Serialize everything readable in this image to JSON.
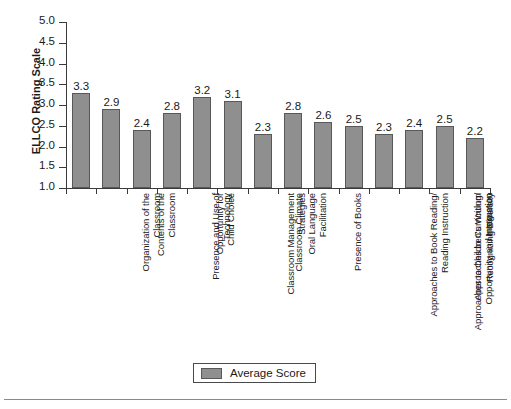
{
  "chart_data": {
    "type": "bar",
    "title": "",
    "xlabel": "",
    "ylabel": "ELLCO Rating Scale",
    "ylim": [
      1.0,
      5.0
    ],
    "ytick_labels": [
      "5.0",
      "4.5",
      "4.0",
      "3.5",
      "3.0",
      "2.5",
      "2.0",
      "1.5",
      "1.0"
    ],
    "ytick_values": [
      5.0,
      4.5,
      4.0,
      3.5,
      3.0,
      2.5,
      2.0,
      1.5,
      1.0
    ],
    "grid": false,
    "legend_position": "bottom-center",
    "legend": [
      "Average Score"
    ],
    "bar_color": "#8f8f8f",
    "bar_edge_color": "#585858",
    "categories": [
      [
        "Organization of the",
        "Classroom"
      ],
      [
        "Contents of the",
        "Classroom"
      ],
      [
        "Presence and Use of",
        "Technology"
      ],
      [
        "Opportunity for",
        "Child Choice"
      ],
      [
        "Classroom Management",
        "Strategies"
      ],
      [
        "Classroom Climate"
      ],
      [
        "Oral Language",
        "Facilitation"
      ],
      [
        "Presence of Books"
      ],
      [
        "Approaches to Book Reading/",
        "Reading Instruction"
      ],
      [
        "Approaches to Children's Writing/",
        "Opportunity and Instruction"
      ],
      [
        "Approaches to Curriculum",
        "Integration"
      ],
      [
        "Recognizing Diversity"
      ],
      [
        "Facilitating Home Support"
      ],
      [
        "Approaches to",
        "Assessment"
      ]
    ],
    "categories_flat": [
      "Organization of the Classroom",
      "Contents of the Classroom",
      "Presence and Use of Technology",
      "Opportunity for Child Choice",
      "Classroom Management Strategies",
      "Classroom Climate",
      "Oral Language Facilitation",
      "Presence of Books",
      "Approaches to Book Reading/ Reading Instruction",
      "Approaches to Children's Writing/ Opportunity and Instruction",
      "Approaches to Curriculum Integration",
      "Recognizing Diversity",
      "Facilitating Home Support",
      "Approaches to Assessment"
    ],
    "series": [
      {
        "name": "Average Score",
        "values": [
          3.3,
          2.9,
          2.4,
          2.8,
          3.2,
          3.1,
          2.3,
          2.8,
          2.6,
          2.5,
          2.3,
          2.4,
          2.5,
          2.2
        ]
      }
    ],
    "value_labels": [
      "3.3",
      "2.9",
      "2.4",
      "2.8",
      "3.2",
      "3.1",
      "2.3",
      "2.8",
      "2.6",
      "2.5",
      "2.3",
      "2.4",
      "2.5",
      "2.2"
    ]
  }
}
